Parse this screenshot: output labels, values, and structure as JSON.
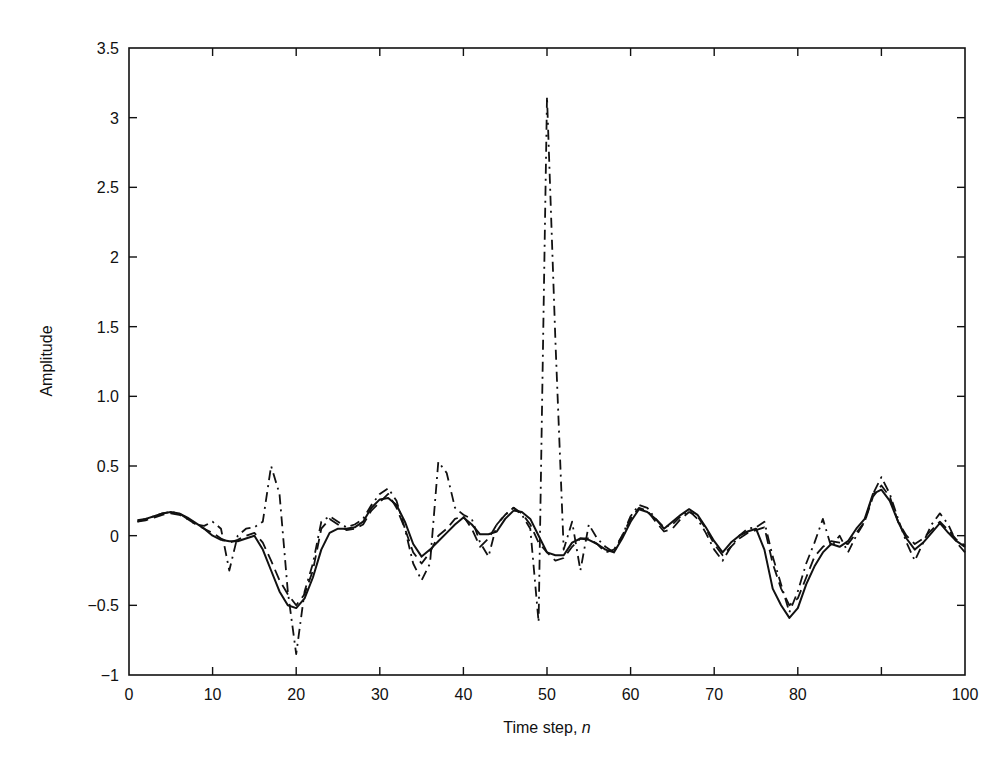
{
  "chart_data": {
    "type": "line",
    "title": "",
    "xlabel": "Time step, ",
    "xlabel_italic": "n",
    "ylabel": "Amplitude",
    "xlim": [
      0,
      100
    ],
    "ylim": [
      -1,
      3.5
    ],
    "grid": false,
    "legend": null,
    "xticks": [
      0,
      10,
      20,
      30,
      40,
      50,
      60,
      70,
      80,
      90,
      100
    ],
    "xtick_labels": [
      "0",
      "10",
      "20",
      "30",
      "40",
      "50",
      "60",
      "70",
      "80",
      "",
      "100"
    ],
    "yticks": [
      -1,
      -0.5,
      0,
      0.5,
      1.0,
      1.5,
      2,
      2.5,
      3,
      3.5
    ],
    "ytick_labels": [
      "−1",
      "−0.5",
      "0",
      "0.5",
      "1.0",
      "1.5",
      "2",
      "2.5",
      "3",
      "3.5"
    ],
    "x": [
      1,
      2,
      3,
      4,
      5,
      6,
      7,
      8,
      9,
      10,
      11,
      12,
      13,
      14,
      15,
      16,
      17,
      18,
      19,
      20,
      21,
      22,
      23,
      24,
      25,
      26,
      27,
      28,
      29,
      30,
      31,
      32,
      33,
      34,
      35,
      36,
      37,
      38,
      39,
      40,
      41,
      42,
      43,
      44,
      45,
      46,
      47,
      48,
      49,
      50,
      51,
      52,
      53,
      54,
      55,
      56,
      57,
      58,
      59,
      60,
      61,
      62,
      63,
      64,
      65,
      66,
      67,
      68,
      69,
      70,
      71,
      72,
      73,
      74,
      75,
      76,
      77,
      78,
      79,
      80,
      81,
      82,
      83,
      84,
      85,
      86,
      87,
      88,
      89,
      90,
      91,
      92,
      93,
      94,
      95,
      96,
      97,
      98,
      99,
      100
    ],
    "series": [
      {
        "name": "solid",
        "style": "solid",
        "values": [
          0.11,
          0.12,
          0.14,
          0.16,
          0.17,
          0.16,
          0.13,
          0.09,
          0.05,
          0.0,
          -0.03,
          -0.04,
          -0.04,
          -0.02,
          0.0,
          -0.1,
          -0.25,
          -0.4,
          -0.5,
          -0.52,
          -0.45,
          -0.3,
          -0.1,
          0.02,
          0.05,
          0.05,
          0.06,
          0.1,
          0.2,
          0.26,
          0.27,
          0.22,
          0.1,
          -0.06,
          -0.15,
          -0.1,
          -0.04,
          0.02,
          0.08,
          0.13,
          0.08,
          0.01,
          0.01,
          0.03,
          0.12,
          0.18,
          0.17,
          0.12,
          0.0,
          -0.12,
          -0.14,
          -0.14,
          -0.05,
          -0.02,
          -0.03,
          -0.06,
          -0.1,
          -0.12,
          -0.02,
          0.1,
          0.19,
          0.17,
          0.12,
          0.05,
          0.1,
          0.15,
          0.19,
          0.15,
          0.06,
          -0.04,
          -0.12,
          -0.05,
          0.0,
          0.03,
          0.05,
          -0.1,
          -0.38,
          -0.5,
          -0.59,
          -0.52,
          -0.35,
          -0.22,
          -0.12,
          -0.06,
          -0.08,
          -0.04,
          0.05,
          0.12,
          0.3,
          0.33,
          0.25,
          0.1,
          -0.02,
          -0.1,
          -0.05,
          0.02,
          0.09,
          0.02,
          -0.04,
          -0.08
        ]
      },
      {
        "name": "dashed",
        "style": "dashed",
        "values": [
          0.1,
          0.11,
          0.13,
          0.15,
          0.16,
          0.15,
          0.12,
          0.08,
          0.05,
          0.02,
          -0.02,
          -0.05,
          -0.03,
          0.0,
          0.02,
          -0.05,
          -0.18,
          -0.32,
          -0.42,
          -0.5,
          -0.42,
          -0.25,
          0.05,
          0.12,
          0.08,
          0.04,
          0.05,
          0.08,
          0.18,
          0.24,
          0.3,
          0.2,
          0.05,
          -0.12,
          -0.2,
          -0.12,
          0.0,
          0.05,
          0.12,
          0.14,
          0.05,
          -0.08,
          -0.02,
          0.08,
          0.15,
          0.2,
          0.16,
          0.08,
          -0.05,
          -0.12,
          -0.18,
          -0.16,
          -0.08,
          -0.02,
          -0.02,
          -0.06,
          -0.12,
          -0.1,
          0.0,
          0.12,
          0.2,
          0.18,
          0.1,
          0.03,
          0.05,
          0.12,
          0.17,
          0.14,
          0.05,
          -0.06,
          -0.14,
          -0.08,
          -0.02,
          0.02,
          0.04,
          0.06,
          -0.2,
          -0.38,
          -0.5,
          -0.45,
          -0.3,
          -0.15,
          -0.08,
          -0.04,
          -0.05,
          -0.06,
          0.02,
          0.1,
          0.28,
          0.36,
          0.28,
          0.1,
          0.0,
          -0.06,
          -0.02,
          0.04,
          0.1,
          0.04,
          -0.03,
          -0.07
        ]
      },
      {
        "name": "dash-dot",
        "style": "dashdot",
        "values": [
          0.1,
          0.12,
          0.14,
          0.16,
          0.17,
          0.16,
          0.12,
          0.08,
          0.07,
          0.1,
          0.05,
          -0.25,
          0.0,
          0.05,
          0.06,
          0.1,
          0.5,
          0.3,
          -0.4,
          -0.85,
          -0.4,
          -0.2,
          0.1,
          0.14,
          0.1,
          0.06,
          0.08,
          0.12,
          0.22,
          0.3,
          0.34,
          0.25,
          0.05,
          -0.2,
          -0.32,
          -0.2,
          0.53,
          0.45,
          0.2,
          0.15,
          0.12,
          -0.05,
          -0.15,
          0.08,
          0.15,
          0.2,
          0.15,
          0.05,
          -0.62,
          3.15,
          1.4,
          -0.1,
          0.1,
          -0.25,
          0.08,
          -0.02,
          -0.08,
          -0.12,
          0.0,
          0.14,
          0.22,
          0.2,
          0.12,
          0.06,
          0.08,
          0.14,
          0.18,
          0.12,
          0.02,
          -0.1,
          -0.18,
          -0.08,
          0.0,
          0.05,
          0.06,
          0.1,
          -0.15,
          -0.35,
          -0.55,
          -0.4,
          -0.2,
          -0.05,
          0.12,
          -0.08,
          0.0,
          -0.12,
          0.0,
          0.1,
          0.3,
          0.42,
          0.3,
          0.12,
          -0.05,
          -0.18,
          -0.05,
          0.08,
          0.16,
          0.08,
          -0.05,
          -0.12
        ]
      }
    ]
  },
  "axes": {
    "x_title": "Time step, ",
    "x_title_var": "n",
    "y_title": "Amplitude"
  }
}
